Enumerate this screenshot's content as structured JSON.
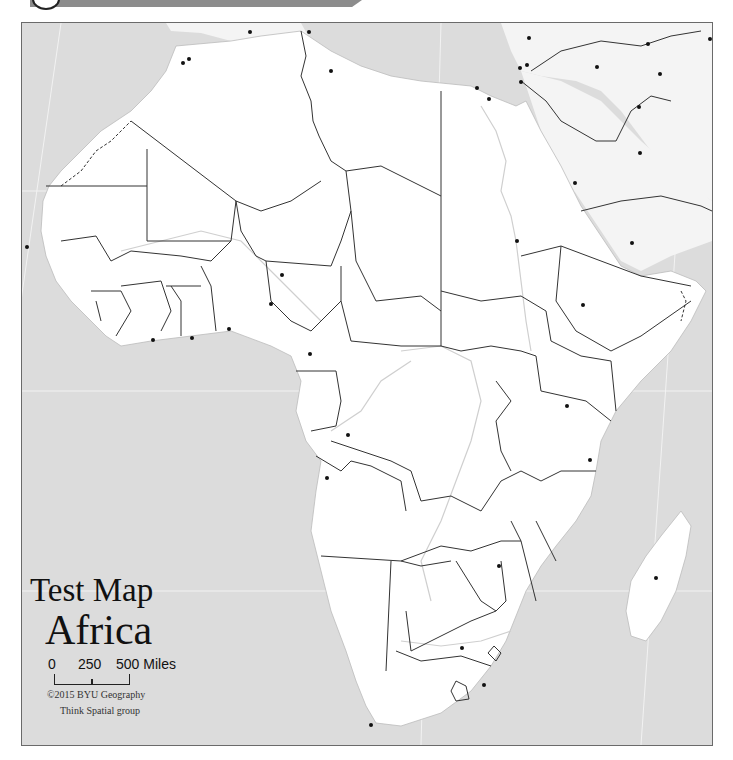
{
  "map": {
    "title": "Test Map",
    "subtitle": "Africa",
    "scale": {
      "labels": [
        "0",
        "250",
        "500 Miles"
      ],
      "unit": "Miles"
    },
    "credits": {
      "line1": "©2015 BYU Geography",
      "line2": "Think Spatial group"
    },
    "colors": {
      "water": "#dcdcdc",
      "land": "#ffffff",
      "border": "#333333",
      "river": "#c8c8c8",
      "city_dot": "#111111",
      "banner": "#8c8c8c"
    },
    "features": {
      "country_borders": "shown",
      "disputed_borders": "dashed",
      "rivers": "light gray",
      "capital_markers": "black dots, unlabeled"
    }
  }
}
